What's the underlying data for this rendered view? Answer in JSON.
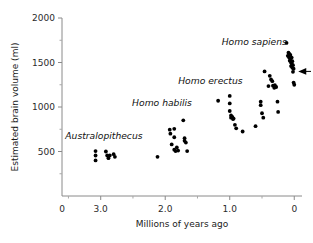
{
  "chart_data": {
    "type": "scatter",
    "title": "",
    "xlabel": "Millions of years ago",
    "ylabel": "Estimated brain volume (ml)",
    "xlim": [
      3.6,
      -0.12
    ],
    "ylim": [
      0,
      2000
    ],
    "x_reversed": true,
    "grid": false,
    "legend": "none",
    "xticks": [
      3.0,
      2.0,
      1.0,
      0.0
    ],
    "xtick_labels": [
      "3.0",
      "2.0",
      "1.0",
      "0"
    ],
    "x_origin_label": "0",
    "xticks_minor": [
      3.5,
      2.5,
      1.5,
      0.5
    ],
    "yticks": [
      500,
      1000,
      1500,
      2000
    ],
    "ytick_labels": [
      "500",
      "1000",
      "1500",
      "2000"
    ],
    "yticks_minor": [
      250,
      750,
      1250,
      1750
    ],
    "y_origin_label": "0",
    "annotations": [
      {
        "id": "arrow-modern-human",
        "text": "",
        "x": 0.0,
        "y": 1400,
        "kind": "left-arrow"
      }
    ],
    "series": [
      {
        "name": "Australopithecus",
        "label_x": 2.95,
        "label_y": 640,
        "points": [
          [
            3.08,
            505
          ],
          [
            3.08,
            455
          ],
          [
            3.08,
            400
          ],
          [
            2.92,
            500
          ],
          [
            2.9,
            455
          ],
          [
            2.88,
            425
          ],
          [
            2.86,
            455
          ],
          [
            2.8,
            470
          ],
          [
            2.78,
            440
          ]
        ]
      },
      {
        "name": "Homo habilis",
        "label_x": 2.05,
        "label_y": 1010,
        "points": [
          [
            2.12,
            440
          ],
          [
            1.93,
            745
          ],
          [
            1.92,
            700
          ],
          [
            1.9,
            580
          ],
          [
            1.86,
            755
          ],
          [
            1.86,
            660
          ],
          [
            1.86,
            520
          ],
          [
            1.84,
            505
          ],
          [
            1.82,
            545
          ],
          [
            1.8,
            510
          ],
          [
            1.72,
            850
          ],
          [
            1.7,
            650
          ],
          [
            1.7,
            620
          ],
          [
            1.68,
            600
          ],
          [
            1.66,
            505
          ]
        ]
      },
      {
        "name": "Homo erectus",
        "label_x": 1.3,
        "label_y": 1255,
        "points": [
          [
            1.18,
            1070
          ],
          [
            1.0,
            1125
          ],
          [
            1.0,
            1040
          ],
          [
            1.0,
            955
          ],
          [
            0.98,
            905
          ],
          [
            0.98,
            880
          ],
          [
            0.96,
            890
          ],
          [
            0.95,
            865
          ],
          [
            0.94,
            870
          ],
          [
            0.92,
            800
          ],
          [
            0.9,
            760
          ],
          [
            0.8,
            725
          ],
          [
            0.6,
            785
          ],
          [
            0.52,
            1060
          ],
          [
            0.52,
            1020
          ],
          [
            0.5,
            930
          ],
          [
            0.48,
            880
          ]
        ]
      },
      {
        "name": "Homo sapiens",
        "label_x": 0.62,
        "label_y": 1700,
        "points": [
          [
            0.4,
            1235
          ],
          [
            0.38,
            1350
          ],
          [
            0.36,
            1310
          ],
          [
            0.34,
            1290
          ],
          [
            0.33,
            1240
          ],
          [
            0.31,
            1215
          ],
          [
            0.3,
            1245
          ],
          [
            0.28,
            1225
          ],
          [
            0.26,
            1060
          ],
          [
            0.25,
            945
          ],
          [
            0.46,
            1400
          ],
          [
            0.12,
            1720
          ],
          [
            0.1,
            1575
          ],
          [
            0.09,
            1610
          ],
          [
            0.08,
            1555
          ],
          [
            0.08,
            1600
          ],
          [
            0.07,
            1520
          ],
          [
            0.06,
            1585
          ],
          [
            0.06,
            1545
          ],
          [
            0.05,
            1500
          ],
          [
            0.05,
            1460
          ],
          [
            0.04,
            1555
          ],
          [
            0.04,
            1490
          ],
          [
            0.03,
            1515
          ],
          [
            0.03,
            1440
          ],
          [
            0.02,
            1470
          ],
          [
            0.02,
            1395
          ],
          [
            0.01,
            1430
          ],
          [
            0.01,
            1275
          ],
          [
            0.0,
            1250
          ]
        ]
      }
    ]
  }
}
